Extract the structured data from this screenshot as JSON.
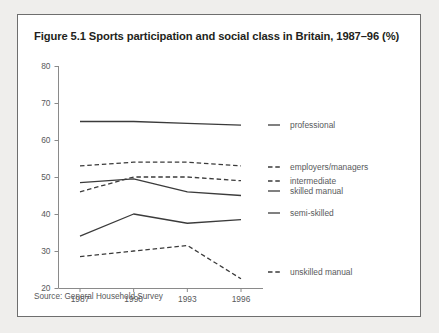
{
  "figure": {
    "title": "Figure 5.1 Sports participation and social class in Britain, 1987–96 (%)",
    "source": "Source: General Household Survey"
  },
  "axis": {
    "y_ticks": [
      "80",
      "70",
      "60",
      "50",
      "40",
      "30",
      "20"
    ],
    "x_ticks": [
      "1987",
      "1990",
      "1993",
      "1996"
    ]
  },
  "labels": {
    "professional": "professional",
    "employers_managers": "employers/managers",
    "intermediate": "intermediate",
    "skilled_manual": "skilled manual",
    "semi_skilled": "semi-skilled",
    "unskilled_manual": "unskilled manual"
  },
  "colors": {
    "line": "#3b3b3b",
    "axis": "#8a8a8a",
    "text": "#58595b",
    "title": "#231f20",
    "page_background": "#efeeec",
    "panel_background": "#ffffff",
    "panel_border": "#6e6e6e"
  },
  "chart_data": {
    "type": "line",
    "title": "Figure 5.1 Sports participation and social class in Britain, 1987–96 (%)",
    "xlabel": "",
    "ylabel": "",
    "x": [
      "1987",
      "1990",
      "1993",
      "1996"
    ],
    "ylim": [
      20,
      80
    ],
    "ytick_step": 10,
    "grid": false,
    "legend": "inline-right",
    "source": "Source: General Household Survey",
    "series": [
      {
        "name": "professional",
        "style": "solid",
        "values": [
          65,
          65,
          64.5,
          64
        ]
      },
      {
        "name": "employers/managers",
        "style": "dashed",
        "values": [
          53,
          54,
          54,
          53
        ]
      },
      {
        "name": "intermediate",
        "style": "dashed",
        "values": [
          46,
          50,
          50,
          49
        ]
      },
      {
        "name": "skilled manual",
        "style": "solid",
        "values": [
          48.5,
          49.5,
          46,
          45
        ]
      },
      {
        "name": "semi-skilled",
        "style": "solid",
        "values": [
          34,
          40,
          37.5,
          38.5
        ]
      },
      {
        "name": "unskilled manual",
        "style": "dashed",
        "values": [
          28.5,
          30,
          31.5,
          22.5
        ]
      }
    ]
  }
}
